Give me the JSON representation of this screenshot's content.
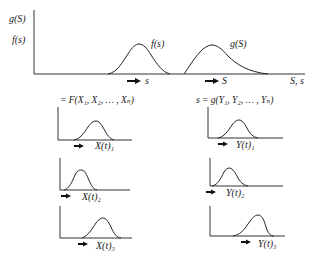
{
  "diagram": {
    "type": "probability-distribution-diagram",
    "main_plot": {
      "y_axis_labels": [
        "g(S)",
        "f(s)"
      ],
      "x_axis_label": "S, s",
      "curves": [
        {
          "name": "load-distribution",
          "label": "f(s)",
          "arrow_label": "s"
        },
        {
          "name": "strength-distribution",
          "label": "g(S)",
          "arrow_label": "S"
        }
      ]
    },
    "left_column": {
      "equation": "= F(X₁, X₂, … , Xₙ)",
      "subplots": [
        {
          "label": "X(t)₁"
        },
        {
          "label": "X(t)₂"
        },
        {
          "label": "X(t)₃"
        }
      ]
    },
    "right_column": {
      "equation": "s = g(Y₁, Y₂, … , Yₙ)",
      "subplots": [
        {
          "label": "Y(t)₁"
        },
        {
          "label": "Y(t)₂"
        },
        {
          "label": "Y(t)₃"
        }
      ]
    }
  }
}
